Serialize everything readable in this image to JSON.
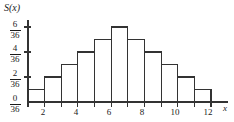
{
  "chart_data": {
    "type": "bar",
    "title": "",
    "subtitle": "",
    "xlabel": "x",
    "ylabel": "S(x)",
    "categories": [
      2,
      3,
      4,
      5,
      6,
      7,
      8,
      9,
      10,
      11,
      12
    ],
    "values": [
      1,
      2,
      3,
      4,
      5,
      6,
      5,
      4,
      3,
      2,
      1
    ],
    "value_denominator": 36,
    "value_labels": [
      "1/36",
      "2/36",
      "3/36",
      "4/36",
      "5/36",
      "6/36",
      "5/36",
      "4/36",
      "3/36",
      "2/36",
      "1/36"
    ],
    "ylim": [
      0,
      6
    ],
    "xlim": [
      1.5,
      12.5
    ],
    "grid": false,
    "legend": null,
    "bar_fill": "#ffffff",
    "bar_stroke": "#333333",
    "axis_color": "#333333",
    "yticks": [
      {
        "value": 0,
        "numerator": "0",
        "denominator": "36"
      },
      {
        "value": 2,
        "numerator": "2",
        "denominator": "36"
      },
      {
        "value": 4,
        "numerator": "4",
        "denominator": "36"
      },
      {
        "value": 6,
        "numerator": "6",
        "denominator": "36"
      }
    ],
    "xticks": [
      {
        "value": 2,
        "label": "2"
      },
      {
        "value": 4,
        "label": "4"
      },
      {
        "value": 6,
        "label": "6"
      },
      {
        "value": 8,
        "label": "8"
      },
      {
        "value": 10,
        "label": "10"
      },
      {
        "value": 12,
        "label": "12"
      }
    ]
  },
  "axes": {
    "y_axis_title": "S(x)",
    "x_axis_title": "x"
  },
  "ytick_labels": {
    "t6": {
      "num": "6",
      "den": "36"
    },
    "t4": {
      "num": "4",
      "den": "36"
    },
    "t2": {
      "num": "2",
      "den": "36"
    },
    "t0": {
      "num": "0",
      "den": "36"
    }
  },
  "xtick_labels": {
    "x2": "2",
    "x4": "4",
    "x6": "6",
    "x8": "8",
    "x10": "10",
    "x12": "12"
  }
}
